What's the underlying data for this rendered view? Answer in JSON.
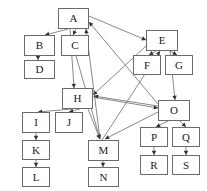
{
  "diagram": {
    "type": "directed-graph",
    "background_color": "#ffffff",
    "node_border_color": "#6b6b6b",
    "node_fill_color": "#ffffff",
    "edge_color": "#6b6b6b",
    "arrow_color": "#333333",
    "nodes": [
      {
        "id": "A",
        "label": "A",
        "x": 58,
        "y": 8,
        "w": 31,
        "h": 21
      },
      {
        "id": "B",
        "label": "B",
        "x": 24,
        "y": 35,
        "w": 31,
        "h": 21
      },
      {
        "id": "C",
        "label": "C",
        "x": 61,
        "y": 35,
        "w": 28,
        "h": 21
      },
      {
        "id": "D",
        "label": "D",
        "x": 24,
        "y": 60,
        "w": 31,
        "h": 19
      },
      {
        "id": "E",
        "label": "E",
        "x": 146,
        "y": 30,
        "w": 32,
        "h": 21
      },
      {
        "id": "F",
        "label": "F",
        "x": 133,
        "y": 55,
        "w": 28,
        "h": 20
      },
      {
        "id": "G",
        "label": "G",
        "x": 165,
        "y": 55,
        "w": 28,
        "h": 20
      },
      {
        "id": "H",
        "label": "H",
        "x": 62,
        "y": 88,
        "w": 31,
        "h": 21
      },
      {
        "id": "I",
        "label": "I",
        "x": 22,
        "y": 112,
        "w": 28,
        "h": 21
      },
      {
        "id": "J",
        "label": "J",
        "x": 55,
        "y": 112,
        "w": 28,
        "h": 21
      },
      {
        "id": "K",
        "label": "K",
        "x": 22,
        "y": 140,
        "w": 28,
        "h": 20
      },
      {
        "id": "L",
        "label": "L",
        "x": 22,
        "y": 167,
        "w": 28,
        "h": 20
      },
      {
        "id": "M",
        "label": "M",
        "x": 88,
        "y": 140,
        "w": 31,
        "h": 21
      },
      {
        "id": "N",
        "label": "N",
        "x": 88,
        "y": 167,
        "w": 31,
        "h": 20
      },
      {
        "id": "O",
        "label": "O",
        "x": 158,
        "y": 100,
        "w": 32,
        "h": 21
      },
      {
        "id": "P",
        "label": "P",
        "x": 140,
        "y": 127,
        "w": 28,
        "h": 20
      },
      {
        "id": "Q",
        "label": "Q",
        "x": 172,
        "y": 127,
        "w": 28,
        "h": 20
      },
      {
        "id": "R",
        "label": "R",
        "x": 140,
        "y": 155,
        "w": 28,
        "h": 20
      },
      {
        "id": "S",
        "label": "S",
        "x": 172,
        "y": 155,
        "w": 28,
        "h": 20
      }
    ],
    "edges": [
      {
        "from": "A",
        "to": "B",
        "x1": 68,
        "y1": 29,
        "x2": 45,
        "y2": 35
      },
      {
        "from": "A",
        "to": "C",
        "x1": 76,
        "y1": 29,
        "x2": 73,
        "y2": 35
      },
      {
        "from": "A",
        "to": "H",
        "x1": 70,
        "y1": 29,
        "x2": 74,
        "y2": 88
      },
      {
        "from": "A",
        "to": "E",
        "x1": 89,
        "y1": 16,
        "x2": 146,
        "y2": 40
      },
      {
        "from": "B",
        "to": "D",
        "x1": 38,
        "y1": 56,
        "x2": 38,
        "y2": 60
      },
      {
        "from": "C",
        "to": "M",
        "x1": 76,
        "y1": 56,
        "x2": 100,
        "y2": 139
      },
      {
        "from": "E",
        "to": "F",
        "x1": 156,
        "y1": 51,
        "x2": 149,
        "y2": 55
      },
      {
        "from": "E",
        "to": "G",
        "x1": 170,
        "y1": 51,
        "x2": 177,
        "y2": 55
      },
      {
        "from": "E",
        "to": "O",
        "x1": 170,
        "y1": 51,
        "x2": 175,
        "y2": 100
      },
      {
        "from": "E",
        "to": "H",
        "x1": 146,
        "y1": 46,
        "x2": 93,
        "y2": 95
      },
      {
        "from": "M",
        "to": "E",
        "x1": 102,
        "y1": 140,
        "x2": 160,
        "y2": 51
      },
      {
        "from": "M",
        "to": "A",
        "x1": 100,
        "y1": 139,
        "x2": 86,
        "y2": 29
      },
      {
        "from": "H",
        "to": "I",
        "x1": 72,
        "y1": 109,
        "x2": 38,
        "y2": 112
      },
      {
        "from": "H",
        "to": "J",
        "x1": 80,
        "y1": 109,
        "x2": 69,
        "y2": 112
      },
      {
        "from": "H",
        "to": "M",
        "x1": 88,
        "y1": 109,
        "x2": 100,
        "y2": 139
      },
      {
        "from": "H",
        "to": "O",
        "x1": 93,
        "y1": 97,
        "x2": 158,
        "y2": 108
      },
      {
        "from": "I",
        "to": "K",
        "x1": 36,
        "y1": 133,
        "x2": 36,
        "y2": 140
      },
      {
        "from": "K",
        "to": "L",
        "x1": 36,
        "y1": 160,
        "x2": 36,
        "y2": 167
      },
      {
        "from": "M",
        "to": "N",
        "x1": 103,
        "y1": 161,
        "x2": 103,
        "y2": 167
      },
      {
        "from": "O",
        "to": "P",
        "x1": 168,
        "y1": 121,
        "x2": 156,
        "y2": 127
      },
      {
        "from": "O",
        "to": "Q",
        "x1": 180,
        "y1": 121,
        "x2": 186,
        "y2": 127
      },
      {
        "from": "O",
        "to": "H",
        "x1": 158,
        "y1": 106,
        "x2": 94,
        "y2": 96
      },
      {
        "from": "O",
        "to": "A",
        "x1": 158,
        "y1": 104,
        "x2": 89,
        "y2": 22
      },
      {
        "from": "O",
        "to": "M",
        "x1": 158,
        "y1": 112,
        "x2": 105,
        "y2": 139
      },
      {
        "from": "P",
        "to": "R",
        "x1": 154,
        "y1": 147,
        "x2": 154,
        "y2": 155
      },
      {
        "from": "Q",
        "to": "S",
        "x1": 186,
        "y1": 147,
        "x2": 186,
        "y2": 155
      }
    ]
  }
}
